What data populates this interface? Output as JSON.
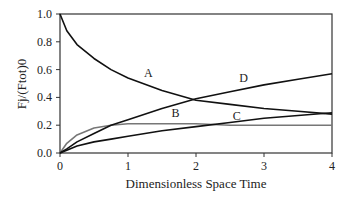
{
  "chart_data": {
    "type": "line",
    "title": "",
    "xlabel": "Dimensionless Space Time",
    "ylabel": "Fj/(Ftot)0",
    "xlim": [
      0,
      4
    ],
    "ylim": [
      0,
      1.0
    ],
    "x_ticks": [
      "0",
      "1",
      "2",
      "3",
      "4"
    ],
    "y_ticks": [
      "0.0",
      "0.2",
      "0.4",
      "0.6",
      "0.8",
      "1.0"
    ],
    "grid": false,
    "x": [
      0,
      0.1,
      0.25,
      0.5,
      0.75,
      1,
      1.5,
      2,
      2.5,
      3,
      3.5,
      4
    ],
    "series": [
      {
        "name": "A",
        "color": "#111111",
        "values": [
          1.0,
          0.88,
          0.78,
          0.68,
          0.6,
          0.54,
          0.45,
          0.38,
          0.35,
          0.32,
          0.3,
          0.28
        ]
      },
      {
        "name": "B",
        "color": "#777777",
        "values": [
          0.0,
          0.07,
          0.13,
          0.18,
          0.2,
          0.21,
          0.21,
          0.21,
          0.2,
          0.2,
          0.2,
          0.2
        ]
      },
      {
        "name": "C",
        "color": "#111111",
        "values": [
          0.0,
          0.02,
          0.05,
          0.08,
          0.1,
          0.12,
          0.16,
          0.19,
          0.22,
          0.25,
          0.27,
          0.29
        ]
      },
      {
        "name": "D",
        "color": "#111111",
        "values": [
          0.0,
          0.03,
          0.08,
          0.14,
          0.2,
          0.24,
          0.32,
          0.39,
          0.44,
          0.49,
          0.53,
          0.57
        ]
      }
    ],
    "annotations": [
      {
        "text": "A",
        "x": 1.3,
        "y": 0.55
      },
      {
        "text": "B",
        "x": 1.7,
        "y": 0.26
      },
      {
        "text": "C",
        "x": 2.6,
        "y": 0.24
      },
      {
        "text": "D",
        "x": 2.7,
        "y": 0.51
      }
    ]
  }
}
